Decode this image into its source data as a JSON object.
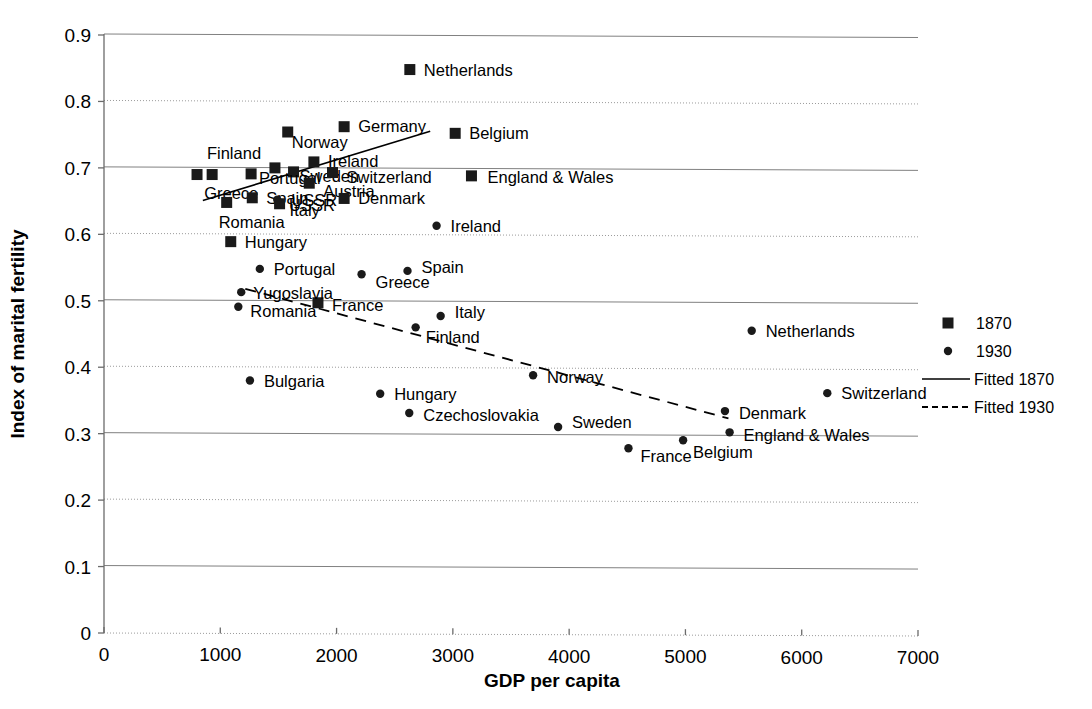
{
  "chart_data": {
    "type": "scatter",
    "title": "",
    "xlabel": "GDP per capita",
    "ylabel": "Index of marital fertility",
    "xlim": [
      0,
      7000
    ],
    "ylim": [
      0,
      0.9
    ],
    "xticks": [
      "0",
      "1000",
      "2000",
      "3000",
      "4000",
      "5000",
      "6000",
      "7000"
    ],
    "yticks": [
      "0",
      "0.1",
      "0.2",
      "0.3",
      "0.4",
      "0.5",
      "0.6",
      "0.7",
      "0.8",
      "0.9"
    ],
    "grid": true,
    "legend_position": "right",
    "legend": [
      {
        "label": "1870",
        "kind": "square"
      },
      {
        "label": "1930",
        "kind": "circle"
      },
      {
        "label": "Fitted 1870",
        "kind": "solid-line"
      },
      {
        "label": "Fitted 1930",
        "kind": "dashed-line"
      }
    ],
    "series": [
      {
        "name": "1870",
        "marker": "square",
        "points": [
          {
            "label": "Netherlands",
            "x": 2630,
            "y": 0.848,
            "lx": 14,
            "ly": 6
          },
          {
            "label": "Germany",
            "x": 2065,
            "y": 0.762,
            "lx": 14,
            "ly": 0
          },
          {
            "label": "Norway",
            "x": 1580,
            "y": 0.754,
            "lx": 4,
            "ly": 16
          },
          {
            "label": "Belgium",
            "x": 3020,
            "y": 0.752,
            "lx": 14,
            "ly": 6
          },
          {
            "label": "Ireland",
            "x": 1805,
            "y": 0.709,
            "lx": 14,
            "ly": 0
          },
          {
            "label": "Finland",
            "x": 1470,
            "y": 0.7,
            "lx": -68,
            "ly": -9
          },
          {
            "label": "Sweden",
            "x": 1630,
            "y": 0.694,
            "lx": 6,
            "ly": 10
          },
          {
            "label": "Switzerland",
            "x": 1965,
            "y": 0.693,
            "lx": 14,
            "ly": 10
          },
          {
            "label": "Portugal",
            "x": 1265,
            "y": 0.691,
            "lx": 8,
            "ly": 10
          },
          {
            "label": "England & Wales",
            "x": 3160,
            "y": 0.688,
            "lx": 16,
            "ly": 7
          },
          {
            "label": "Greece",
            "x": 930,
            "y": 0.69,
            "lx": -8,
            "ly": 24
          },
          {
            "label": "USSR",
            "x": 800,
            "y": 0.69,
            "lx": 92,
            "ly": 36
          },
          {
            "label": "Austria",
            "x": 1765,
            "y": 0.677,
            "lx": 14,
            "ly": 14
          },
          {
            "label": "Spain",
            "x": 1275,
            "y": 0.655,
            "lx": 14,
            "ly": 6
          },
          {
            "label": "Denmark",
            "x": 2065,
            "y": 0.654,
            "lx": 14,
            "ly": 6
          },
          {
            "label": "Italy",
            "x": 1510,
            "y": 0.646,
            "lx": 10,
            "ly": 12
          },
          {
            "label": "Romania",
            "x": 1055,
            "y": 0.648,
            "lx": -8,
            "ly": 26
          },
          {
            "label": "Hungary",
            "x": 1090,
            "y": 0.589,
            "lx": 14,
            "ly": 6
          },
          {
            "label": "France",
            "x": 1840,
            "y": 0.497,
            "lx": 14,
            "ly": 8
          }
        ]
      },
      {
        "name": "1930",
        "marker": "circle",
        "points": [
          {
            "label": "Ireland",
            "x": 2860,
            "y": 0.613,
            "lx": 14,
            "ly": 6
          },
          {
            "label": "Portugal",
            "x": 1340,
            "y": 0.548,
            "lx": 14,
            "ly": 6
          },
          {
            "label": "Spain",
            "x": 2610,
            "y": 0.545,
            "lx": 14,
            "ly": 2
          },
          {
            "label": "Greece",
            "x": 2215,
            "y": 0.54,
            "lx": 14,
            "ly": 14
          },
          {
            "label": "Yugoslavia",
            "x": 1180,
            "y": 0.513,
            "lx": 12,
            "ly": 7
          },
          {
            "label": "USSR",
            "x": 1490,
            "y": 0.652,
            "lx": 14,
            "ly": 6
          },
          {
            "label": "Romania",
            "x": 1155,
            "y": 0.491,
            "lx": 12,
            "ly": 10
          },
          {
            "label": "Italy",
            "x": 2895,
            "y": 0.477,
            "lx": 14,
            "ly": 2
          },
          {
            "label": "Finland",
            "x": 2680,
            "y": 0.46,
            "lx": 10,
            "ly": 16
          },
          {
            "label": "Netherlands",
            "x": 5570,
            "y": 0.455,
            "lx": 14,
            "ly": 6
          },
          {
            "label": "Norway",
            "x": 3690,
            "y": 0.388,
            "lx": 14,
            "ly": 8
          },
          {
            "label": "Bulgaria",
            "x": 1255,
            "y": 0.38,
            "lx": 14,
            "ly": 6
          },
          {
            "label": "Switzerland",
            "x": 6220,
            "y": 0.361,
            "lx": 14,
            "ly": 6
          },
          {
            "label": "Hungary",
            "x": 2375,
            "y": 0.36,
            "lx": 14,
            "ly": 6
          },
          {
            "label": "Denmark",
            "x": 5340,
            "y": 0.334,
            "lx": 14,
            "ly": 8
          },
          {
            "label": "Czechoslovakia",
            "x": 2625,
            "y": 0.331,
            "lx": 14,
            "ly": 8
          },
          {
            "label": "Sweden",
            "x": 3905,
            "y": 0.31,
            "lx": 14,
            "ly": 1
          },
          {
            "label": "England & Wales",
            "x": 5380,
            "y": 0.302,
            "lx": 14,
            "ly": 9
          },
          {
            "label": "Belgium",
            "x": 4980,
            "y": 0.29,
            "lx": 10,
            "ly": 18
          },
          {
            "label": "France",
            "x": 4510,
            "y": 0.278,
            "lx": 12,
            "ly": 14
          }
        ]
      }
    ],
    "fits": [
      {
        "name": "Fitted 1870",
        "style": "solid",
        "x0": 850,
        "y0": 0.651,
        "x1": 2805,
        "y1": 0.755
      },
      {
        "name": "Fitted 1930",
        "style": "dashed",
        "x0": 1215,
        "y0": 0.518,
        "x1": 5370,
        "y1": 0.323
      }
    ]
  }
}
